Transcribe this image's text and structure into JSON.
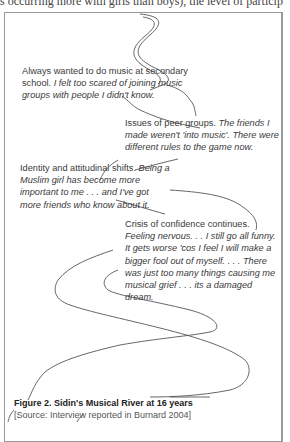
{
  "header_fragment": "s occurring more with girls than boys), the level of particip",
  "notes": [
    {
      "heading": "Always wanted to do music at secondary school.",
      "quote": "I felt too scared of joining music groups with people I didn't know."
    },
    {
      "heading": "Issues of peer groups.",
      "quote": "The friends I made weren't 'into music'.  There were different rules to the game now."
    },
    {
      "heading": "Identity and attitudinal shifts.",
      "quote": "Being a Muslim girl has become more important to me . . . and I've got more friends who know about it."
    },
    {
      "heading": "Crisis of confidence continues.",
      "quote": "Feeling nervous. . . I still go all funny. It gets worse 'cos I feel I will make a bigger fool out of myself. . . . There was just too many things causing me musical grief . . . its a damaged dream."
    }
  ],
  "caption": {
    "title": "Figure 2. Sidin's Musical River at 16 years",
    "source": "[Source: Interview reported in Burnard 2004]"
  },
  "colors": {
    "frame": "#999999",
    "river_line": "#555555",
    "text": "#3a3a3a"
  }
}
